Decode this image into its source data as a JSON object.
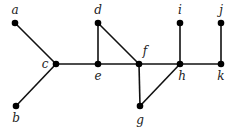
{
  "diagram": {
    "type": "graph",
    "nodes": [
      {
        "id": "a",
        "label": "a",
        "x": 15,
        "y": 23,
        "lx": 15,
        "ly": 14
      },
      {
        "id": "b",
        "label": "b",
        "x": 16,
        "y": 106,
        "lx": 16,
        "ly": 122
      },
      {
        "id": "c",
        "label": "c",
        "x": 56,
        "y": 64,
        "lx": 45,
        "ly": 68
      },
      {
        "id": "d",
        "label": "d",
        "x": 98,
        "y": 23,
        "lx": 98,
        "ly": 14
      },
      {
        "id": "e",
        "label": "e",
        "x": 98,
        "y": 64,
        "lx": 98,
        "ly": 80
      },
      {
        "id": "f",
        "label": "f",
        "x": 139,
        "y": 64,
        "lx": 145,
        "ly": 55
      },
      {
        "id": "g",
        "label": "g",
        "x": 140,
        "y": 106,
        "lx": 140,
        "ly": 124
      },
      {
        "id": "h",
        "label": "h",
        "x": 180,
        "y": 64,
        "lx": 182,
        "ly": 80
      },
      {
        "id": "i",
        "label": "i",
        "x": 180,
        "y": 23,
        "lx": 180,
        "ly": 14
      },
      {
        "id": "j",
        "label": "j",
        "x": 221,
        "y": 23,
        "lx": 221,
        "ly": 14
      },
      {
        "id": "k",
        "label": "k",
        "x": 221,
        "y": 64,
        "lx": 221,
        "ly": 80
      }
    ],
    "edges": [
      [
        "a",
        "c"
      ],
      [
        "b",
        "c"
      ],
      [
        "c",
        "e"
      ],
      [
        "e",
        "d"
      ],
      [
        "d",
        "f"
      ],
      [
        "e",
        "f"
      ],
      [
        "f",
        "h"
      ],
      [
        "h",
        "k"
      ],
      [
        "h",
        "i"
      ],
      [
        "k",
        "j"
      ],
      [
        "f",
        "g"
      ],
      [
        "g",
        "h"
      ]
    ],
    "colors": {
      "edge": "#111111",
      "node": "#000000",
      "label": "#222222"
    }
  }
}
